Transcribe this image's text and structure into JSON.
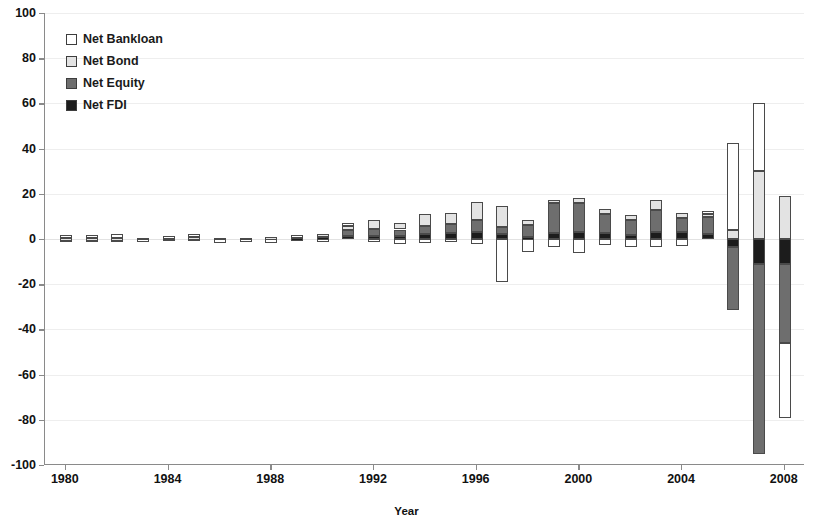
{
  "chart_data": {
    "type": "bar",
    "subtype": "stacked-bar-positive-negative",
    "title": "",
    "xlabel": "Year",
    "ylabel": "",
    "ylim": [
      -100,
      100
    ],
    "ytick_step": 20,
    "yticks": [
      "100",
      "80",
      "60",
      "40",
      "20",
      "0",
      "-20",
      "-40",
      "-60",
      "-80",
      "-100"
    ],
    "xticks": [
      "1980",
      "1984",
      "1988",
      "1992",
      "1996",
      "2000",
      "2004",
      "2008"
    ],
    "xtick_step": 4,
    "grid": true,
    "legend_position": "top-left",
    "categories": [
      1980,
      1981,
      1982,
      1983,
      1984,
      1985,
      1986,
      1987,
      1988,
      1989,
      1990,
      1991,
      1992,
      1993,
      1994,
      1995,
      1996,
      1997,
      1998,
      1999,
      2000,
      2001,
      2002,
      2003,
      2004,
      2005,
      2006,
      2007,
      2008
    ],
    "series": [
      {
        "name": "Net Bankloan",
        "color": "#ffffff",
        "values": [
          1.4,
          1.2,
          1.8,
          -0.2,
          0.6,
          1.2,
          -1.6,
          -1.4,
          -1.6,
          0.4,
          -0.6,
          1.6,
          -1.4,
          -2.0,
          -1.6,
          -1.2,
          -2.2,
          -19.0,
          -5.6,
          -3.4,
          -6.0,
          -2.6,
          -3.6,
          -3.4,
          -3.2,
          1.6,
          38.5,
          30.0,
          -33.0
        ]
      },
      {
        "name": "Net Bond",
        "color": "#e3e3e3",
        "values": [
          0.2,
          0.2,
          0.2,
          0.0,
          0.2,
          0.2,
          0.1,
          0.1,
          0.1,
          0.1,
          0.2,
          1.8,
          3.6,
          3.0,
          5.6,
          4.6,
          8.0,
          9.2,
          2.2,
          1.6,
          2.4,
          2.0,
          2.4,
          4.2,
          2.4,
          1.4,
          4.0,
          30.0,
          19.0
        ]
      },
      {
        "name": "Net Equity",
        "color": "#6e6e6e",
        "values": [
          0.1,
          0.1,
          0.1,
          0.1,
          0.2,
          0.2,
          0.1,
          0.1,
          0.2,
          0.6,
          1.4,
          2.6,
          3.4,
          3.0,
          3.6,
          4.2,
          5.2,
          3.2,
          5.4,
          13.0,
          12.8,
          8.6,
          6.6,
          9.8,
          6.2,
          7.4,
          -28.0,
          -84.0,
          -35.0
        ]
      },
      {
        "name": "Net FDI",
        "color": "#1c1c1c",
        "values": [
          0.2,
          0.2,
          0.2,
          0.2,
          0.4,
          0.4,
          0.3,
          0.3,
          0.4,
          0.6,
          0.8,
          1.2,
          1.2,
          1.2,
          2.0,
          2.6,
          3.0,
          2.0,
          1.0,
          2.8,
          3.0,
          2.6,
          1.6,
          3.2,
          3.0,
          2.2,
          -3.6,
          -11.0,
          -11.0
        ]
      }
    ]
  },
  "legend": {
    "items": [
      {
        "label": "Net Bankloan",
        "swatch": "#ffffff"
      },
      {
        "label": "Net Bond",
        "swatch": "#e3e3e3"
      },
      {
        "label": "Net Equity",
        "swatch": "#6e6e6e"
      },
      {
        "label": "Net FDI",
        "swatch": "#1c1c1c"
      }
    ]
  },
  "axis": {
    "x_title": "Year",
    "y_max_label": "100",
    "y_min_label": "-100"
  },
  "colors": {
    "bankloan": "#ffffff",
    "bond": "#e3e3e3",
    "equity": "#6e6e6e",
    "fdi": "#1c1c1c",
    "axis": "#8a8a8a",
    "grid": "#eeeeee",
    "text": "#111111"
  }
}
